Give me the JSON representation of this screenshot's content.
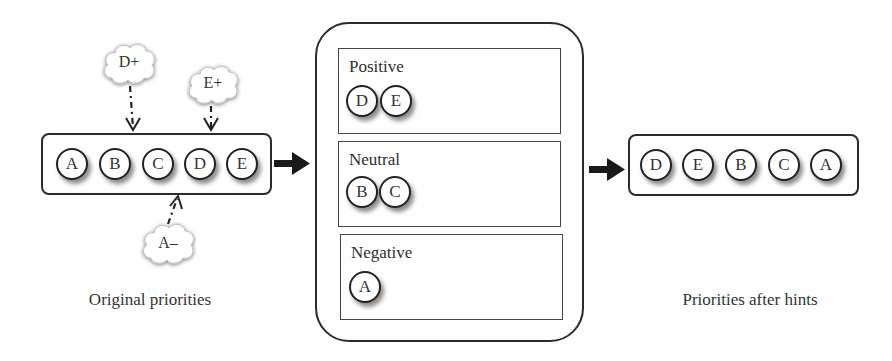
{
  "original": {
    "caption": "Original priorities",
    "items": [
      "A",
      "B",
      "C",
      "D",
      "E"
    ]
  },
  "hints": [
    {
      "label": "D+",
      "target": "D",
      "direction": "down"
    },
    {
      "label": "E+",
      "target": "E",
      "direction": "down"
    },
    {
      "label": "A–",
      "target": "C/D gap",
      "direction": "up"
    }
  ],
  "buckets": [
    {
      "title": "Positive",
      "items": [
        "D",
        "E"
      ]
    },
    {
      "title": "Neutral",
      "items": [
        "B",
        "C"
      ]
    },
    {
      "title": "Negative",
      "items": [
        "A"
      ]
    }
  ],
  "result": {
    "caption": "Priorities after hints",
    "items": [
      "D",
      "E",
      "B",
      "C",
      "A"
    ]
  },
  "colors": {
    "stroke": "#2b2b2b",
    "background": "#ffffff",
    "text": "#333333"
  }
}
